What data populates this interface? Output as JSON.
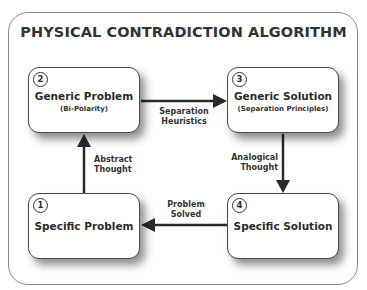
{
  "title": "PHYSICAL CONTRADICTION ALGORITHM",
  "nodes": [
    {
      "id": 2,
      "number": "2",
      "title": "Generic Problem",
      "subtitle": "(Bi-Polarity)"
    },
    {
      "id": 3,
      "number": "3",
      "title": "Generic Solution",
      "subtitle": "(Separation Principles)"
    },
    {
      "id": 1,
      "number": "1",
      "title": "Specific Problem",
      "subtitle": ""
    },
    {
      "id": 4,
      "number": "4",
      "title": "Specific Solution",
      "subtitle": ""
    }
  ],
  "edges": [
    {
      "from": 1,
      "to": 2,
      "label": "Abstract\nThought"
    },
    {
      "from": 2,
      "to": 3,
      "label": "Separation\nHeuristics"
    },
    {
      "from": 3,
      "to": 4,
      "label": "Analogical\nThought"
    },
    {
      "from": 4,
      "to": 1,
      "label": "Problem\nSolved"
    }
  ],
  "colors": {
    "stroke": "#2b2b2b",
    "border": "#8a8a8a",
    "background": "#ffffff"
  }
}
